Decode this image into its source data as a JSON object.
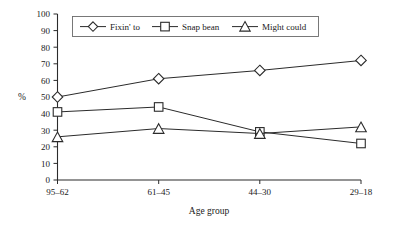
{
  "chart_data": {
    "type": "line",
    "title": "",
    "xlabel": "Age group",
    "ylabel": "%",
    "categories": [
      "95–62",
      "61–45",
      "44–30",
      "29–18"
    ],
    "ylim": [
      0,
      100
    ],
    "yticks": [
      0,
      10,
      20,
      30,
      40,
      50,
      60,
      70,
      80,
      90,
      100
    ],
    "ytick_labels": [
      "0",
      "10",
      "20",
      "30",
      "40",
      "50",
      "60",
      "70",
      "80",
      "90",
      "100"
    ],
    "grid": false,
    "legend_position": "top-center",
    "series": [
      {
        "name": "Fixin' to",
        "marker": "diamond",
        "values": [
          50,
          61,
          66,
          72
        ]
      },
      {
        "name": "Snap bean",
        "marker": "square",
        "values": [
          41,
          44,
          29,
          22
        ]
      },
      {
        "name": "Might could",
        "marker": "triangle",
        "values": [
          26,
          31,
          28,
          32
        ]
      }
    ]
  },
  "axes": {
    "y_axis_label": "%",
    "x_axis_label": "Age group",
    "y_ticks": [
      "100",
      "90",
      "80",
      "70",
      "60",
      "50",
      "40",
      "30",
      "20",
      "10",
      "0"
    ],
    "x_ticks": [
      "95–62",
      "61–45",
      "44–30",
      "29–18"
    ]
  },
  "legend": {
    "entries": [
      {
        "label": "Fixin' to",
        "marker": "diamond-marker"
      },
      {
        "label": "Snap bean",
        "marker": "square-marker"
      },
      {
        "label": "Might could",
        "marker": "triangle-marker"
      }
    ]
  },
  "colors": {
    "line": "#2b2b2b",
    "marker_fill": "#ffffff",
    "axis": "#2b2b2b",
    "legend_border": "#6b6b6b",
    "text": "#1a1a1a",
    "background": "#ffffff"
  }
}
